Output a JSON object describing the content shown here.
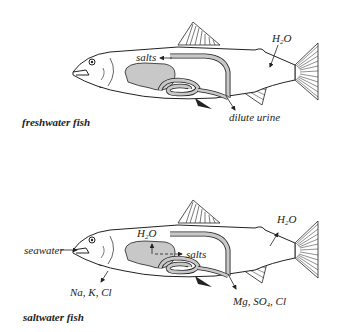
{
  "colors": {
    "organ_fill": "#c8c8c8",
    "outline": "#222222",
    "background": "#ffffff"
  },
  "freshwater": {
    "caption": "freshwater fish",
    "labels": {
      "salts": "salts",
      "water_pre": "H",
      "water_sub": "2",
      "water_post": "O",
      "urine": "dilute urine"
    }
  },
  "saltwater": {
    "caption": "saltwater fish",
    "labels": {
      "seawater": "seawater",
      "water1_pre": "H",
      "water1_sub": "2",
      "water1_post": "O",
      "salts": "salts",
      "water2_pre": "H",
      "water2_sub": "2",
      "water2_post": "O",
      "gill_ions": "Na, K, Cl",
      "kidney_pre": "Mg, SO",
      "kidney_sub": "4",
      "kidney_post": ", Cl"
    }
  }
}
